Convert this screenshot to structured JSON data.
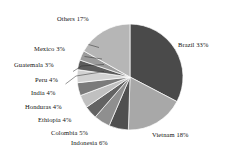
{
  "chart_data": {
    "type": "pie",
    "title": "",
    "subtitle": "",
    "xlabel": "",
    "ylabel": "",
    "legend_position": "none",
    "grid": false,
    "units": "percent",
    "start_angle_deg": 0,
    "direction": "clockwise",
    "categories": [
      "Brazil",
      "Vietnam",
      "Indonesia",
      "Colombia",
      "Ethiopia",
      "Honduras",
      "India",
      "Peru",
      "Guatemala",
      "Mexico",
      "Others"
    ],
    "values": [
      33,
      18,
      6,
      5,
      4,
      4,
      4,
      4,
      3,
      3,
      17
    ],
    "colors": [
      "#4a4a4a",
      "#a8a8a8",
      "#4f4f4f",
      "#8f8f8f",
      "#636363",
      "#c0c0c0",
      "#7a7a7a",
      "#d2d2d2",
      "#5c5c5c",
      "#9b9b9b",
      "#b6b6b6"
    ],
    "slices": [
      {
        "label": "Brazil 33%",
        "name": "Brazil",
        "value": 33,
        "color": "#4a4a4a"
      },
      {
        "label": "Vietnam 18%",
        "name": "Vietnam",
        "value": 18,
        "color": "#a8a8a8"
      },
      {
        "label": "Indonesia 6%",
        "name": "Indonesia",
        "value": 6,
        "color": "#4f4f4f"
      },
      {
        "label": "Colombia 5%",
        "name": "Colombia",
        "value": 5,
        "color": "#8f8f8f"
      },
      {
        "label": "Ethiopia 4%",
        "name": "Ethiopia",
        "value": 4,
        "color": "#636363"
      },
      {
        "label": "Honduras 4%",
        "name": "Honduras",
        "value": 4,
        "color": "#c0c0c0"
      },
      {
        "label": "India 4%",
        "name": "India",
        "value": 4,
        "color": "#7a7a7a"
      },
      {
        "label": "Peru 4%",
        "name": "Peru",
        "value": 4,
        "color": "#d2d2d2"
      },
      {
        "label": "Guatemala 3%",
        "name": "Guatemala",
        "value": 3,
        "color": "#5c5c5c"
      },
      {
        "label": "Mexico 3%",
        "name": "Mexico",
        "value": 3,
        "color": "#9b9b9b"
      },
      {
        "label": "Others 17%",
        "name": "Others",
        "value": 17,
        "color": "#b6b6b6"
      }
    ]
  },
  "labels": {
    "brazil": "Brazil 33%",
    "vietnam": "Vietnam 18%",
    "indonesia": "Indonesia 6%",
    "colombia": "Colombia 5%",
    "ethiopia": "Ethiopia 4%",
    "honduras": "Honduras 4%",
    "india": "India 4%",
    "peru": "Peru 4%",
    "guatemala": "Guatemala 3%",
    "mexico": "Mexico 3%",
    "others": "Others 17%"
  }
}
